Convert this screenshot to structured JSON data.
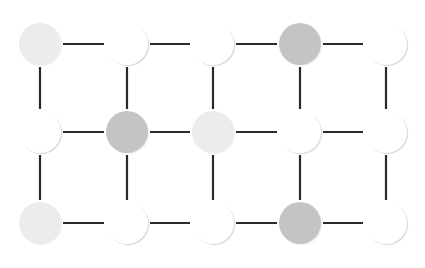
{
  "diagram": {
    "type": "grid-graph",
    "rows": 3,
    "cols": 5,
    "node_radius": 21,
    "col_x": [
      40,
      127,
      213,
      300,
      386
    ],
    "row_y": [
      44,
      132,
      223
    ],
    "colors": {
      "light": "#ececec",
      "dark": "#c4c4c4",
      "white": "#ffffff",
      "shadow": "#d8d8d8",
      "edge": "#2a2a2a"
    },
    "nodes": [
      [
        "light",
        "white",
        "white",
        "dark",
        "white"
      ],
      [
        "white",
        "dark",
        "light",
        "white",
        "white"
      ],
      [
        "light",
        "white",
        "white",
        "dark",
        "white"
      ]
    ],
    "edges": {
      "horizontal": "all adjacent pairs in each row",
      "vertical": "all adjacent pairs in each column"
    }
  }
}
